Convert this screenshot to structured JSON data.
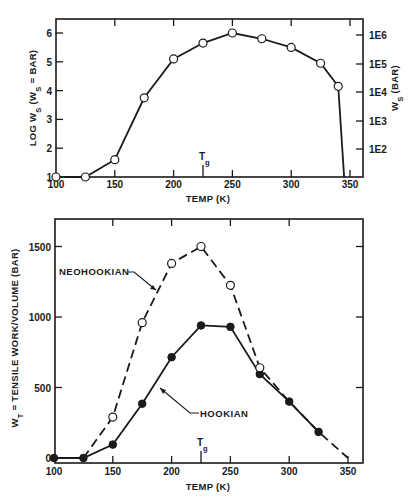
{
  "colors": {
    "ink": "#1a1a1a",
    "background": "#ffffff"
  },
  "chart_data": [
    {
      "type": "line",
      "title": "",
      "xlabel": "TEMP (K)",
      "ylabel": "LOG W_S (W_S = BAR)",
      "ylabel_right": "W_S (BAR)",
      "xlim": [
        100,
        360
      ],
      "ylim": [
        1,
        6.5
      ],
      "x_ticks": [
        100,
        150,
        200,
        250,
        300,
        350
      ],
      "y_ticks": [
        1,
        2,
        3,
        4,
        5,
        6
      ],
      "y_ticks_right": [
        "1E2",
        "1E3",
        "1E4",
        "1E5",
        "1E6"
      ],
      "annotations": [
        {
          "text": "Tg",
          "x": 225
        }
      ],
      "grid": false,
      "series": [
        {
          "name": "LOG W_S",
          "marker": "open-circle",
          "line": "solid",
          "x": [
            100,
            125,
            150,
            175,
            200,
            225,
            250,
            275,
            300,
            325,
            340,
            345
          ],
          "values": [
            1.0,
            1.0,
            1.6,
            3.75,
            5.1,
            5.65,
            6.0,
            5.8,
            5.5,
            4.95,
            4.15,
            1.0
          ]
        }
      ]
    },
    {
      "type": "line",
      "title": "",
      "xlabel": "TEMP (K)",
      "ylabel": "W_T = TENSILE WORK/VOLUME (BAR)",
      "xlim": [
        100,
        360
      ],
      "ylim": [
        0,
        1700
      ],
      "x_ticks": [
        100,
        150,
        200,
        250,
        300,
        350
      ],
      "y_ticks": [
        0,
        500,
        1000,
        1500
      ],
      "annotations": [
        {
          "text": "Tg",
          "x": 225
        },
        {
          "text": "NEOHOOKIAN",
          "points_to": "NEOHOOKIAN"
        },
        {
          "text": "HOOKIAN",
          "points_to": "HOOKIAN"
        }
      ],
      "grid": false,
      "series": [
        {
          "name": "NEOHOOKIAN",
          "marker": "open-circle",
          "line": "dashed",
          "x": [
            125,
            150,
            175,
            200,
            225,
            250,
            275,
            300,
            325,
            350
          ],
          "values": [
            0,
            290,
            960,
            1380,
            1500,
            1225,
            640,
            400,
            185,
            0
          ]
        },
        {
          "name": "HOOKIAN",
          "marker": "filled-circle",
          "line": "solid",
          "x": [
            100,
            125,
            150,
            175,
            200,
            225,
            250,
            275,
            300,
            325
          ],
          "values": [
            0,
            0,
            95,
            385,
            715,
            940,
            930,
            595,
            400,
            185
          ]
        }
      ]
    }
  ],
  "top": {
    "xlabel": "TEMP (K)",
    "ylabel_main": "LOG W",
    "ylabel_sub": "S",
    "ylabel_rest": " (W",
    "ylabel_sub2": "S",
    "ylabel_end": " = BAR)",
    "ylabel_right_main": "W",
    "ylabel_right_sub": "S",
    "ylabel_right_end": " (BAR)",
    "tg_main": "T",
    "tg_sub": "g",
    "x_tick_labels": [
      "100",
      "150",
      "200",
      "250",
      "300",
      "350"
    ],
    "y_tick_labels": [
      "1",
      "2",
      "3",
      "4",
      "5",
      "6"
    ],
    "y_right_tick_labels": [
      "1E2",
      "1E3",
      "1E4",
      "1E5",
      "1E6"
    ]
  },
  "bottom": {
    "xlabel": "TEMP (K)",
    "ylabel_main": "W",
    "ylabel_sub": "T",
    "ylabel_end": " = TENSILE WORK/VOLUME (BAR)",
    "tg_main": "T",
    "tg_sub": "g",
    "neo_label": "NEOHOOKIAN",
    "hook_label": "HOOKIAN",
    "x_tick_labels": [
      "100",
      "150",
      "200",
      "250",
      "300",
      "350"
    ],
    "y_tick_labels": [
      "0",
      "500",
      "1000",
      "1500"
    ]
  }
}
